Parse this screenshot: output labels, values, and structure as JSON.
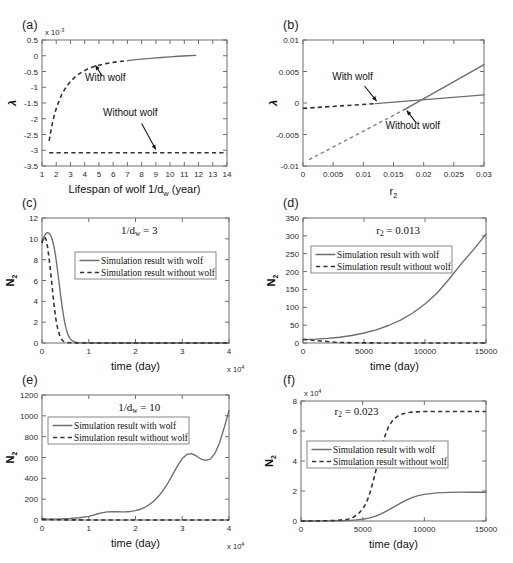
{
  "figure": {
    "panel_labels": {
      "a": "(a)",
      "b": "(b)",
      "c": "(c)",
      "d": "(d)",
      "e": "(e)",
      "f": "(f)"
    },
    "legend_labels": {
      "with": "Simulation result with wolf",
      "without": "Simulation result without wolf"
    },
    "annotations": {
      "with_wolf": "With wolf",
      "without_wolf": "Without wolf"
    },
    "colors": {
      "solid": "#6d6d6d",
      "dashed": "#333333",
      "dashed_light": "#8a8a8a",
      "axis": "#6e6e6e",
      "text": "#111111"
    }
  },
  "chart_data": [
    {
      "id": "a",
      "type": "line",
      "title": "",
      "xlabel": "Lifespan of wolf 1/d_w (year)",
      "ylabel": "λ",
      "y_exponent": "x 10",
      "y_exponent_power": "-3",
      "xlim": [
        1,
        14
      ],
      "ylim": [
        -3.5,
        0.5
      ],
      "xticks": [
        1,
        2,
        3,
        4,
        5,
        6,
        7,
        8,
        9,
        10,
        11,
        12,
        13,
        14
      ],
      "xticklabels": [
        "1",
        "2",
        "3",
        "4",
        "5",
        "6",
        "7",
        "8",
        "9",
        "10",
        "11",
        "12",
        "13",
        "14"
      ],
      "yticks": [
        -3.5,
        -3,
        -2.5,
        -2,
        -1.5,
        -1,
        -0.5,
        0,
        0.5
      ],
      "yticklabels": [
        "-3.5",
        "-3",
        "-2.5",
        "-2",
        "-1.5",
        "-1",
        "-0.5",
        "0",
        "0.5"
      ],
      "grid": false,
      "series": [
        {
          "name": "With wolf (dashed branch)",
          "style": "dashed",
          "x": [
            1.5,
            1.7,
            1.9,
            2.1,
            2.4,
            2.7,
            3.0,
            3.4,
            3.8,
            4.2,
            4.6,
            5.0,
            5.5,
            6.0,
            6.5,
            7.0
          ],
          "y": [
            -2.7,
            -2.2,
            -1.82,
            -1.55,
            -1.22,
            -0.99,
            -0.82,
            -0.64,
            -0.52,
            -0.42,
            -0.35,
            -0.3,
            -0.25,
            -0.21,
            -0.18,
            -0.155
          ]
        },
        {
          "name": "With wolf (solid branch)",
          "style": "solid",
          "x": [
            7.0,
            7.6,
            8.2,
            8.8,
            9.4,
            10.0,
            10.6,
            11.2,
            11.8
          ],
          "y": [
            -0.155,
            -0.125,
            -0.1,
            -0.075,
            -0.055,
            -0.035,
            -0.015,
            0.0,
            0.012
          ]
        },
        {
          "name": "Without wolf",
          "style": "dashed",
          "x": [
            1.5,
            14.0
          ],
          "y": [
            -3.08,
            -3.08
          ]
        }
      ],
      "annotations": [
        {
          "text": "With wolf",
          "text_x": 5.45,
          "text_y": -0.8,
          "arrow_from_x": 5.2,
          "arrow_from_y": -0.63,
          "arrow_to_x": 4.75,
          "arrow_to_y": -0.3
        },
        {
          "text": "Without wolf",
          "text_x": 7.2,
          "text_y": -1.92,
          "arrow_from_x": 8.0,
          "arrow_from_y": -2.15,
          "arrow_to_x": 9.0,
          "arrow_to_y": -2.98
        }
      ]
    },
    {
      "id": "b",
      "type": "line",
      "title": "",
      "xlabel": "r_2",
      "ylabel": "λ",
      "xlim": [
        0,
        0.03
      ],
      "ylim": [
        -0.01,
        0.01
      ],
      "xticks": [
        0,
        0.005,
        0.01,
        0.015,
        0.02,
        0.025,
        0.03
      ],
      "xticklabels": [
        "0",
        "0.005",
        "0.01",
        "0.015",
        "0.02",
        "0.025",
        "0.03"
      ],
      "yticks": [
        -0.01,
        -0.005,
        0,
        0.005,
        0.01
      ],
      "yticklabels": [
        "-0.01",
        "-0.005",
        "0",
        "0.005",
        "0.01"
      ],
      "grid": false,
      "series": [
        {
          "name": "With wolf (dashed branch)",
          "style": "dashed",
          "x": [
            0.0,
            0.012
          ],
          "y": [
            -0.00085,
            -0.0001
          ]
        },
        {
          "name": "With wolf (solid branch)",
          "style": "solid",
          "x": [
            0.012,
            0.03
          ],
          "y": [
            -0.0001,
            0.0013
          ]
        },
        {
          "name": "Without wolf",
          "style": "dashed-light",
          "x": [
            0.001,
            0.0168
          ],
          "y": [
            -0.009,
            -0.00105
          ]
        },
        {
          "name": "Without wolf (solid branch)",
          "style": "solid",
          "x": [
            0.0168,
            0.03
          ],
          "y": [
            -0.00105,
            0.0061
          ]
        }
      ],
      "annotations": [
        {
          "text": "With wolf",
          "text_x": 0.0082,
          "text_y": 0.0036,
          "arrow_from_x": 0.0102,
          "arrow_from_y": 0.0027,
          "arrow_to_x": 0.0122,
          "arrow_to_y": 0.0003
        },
        {
          "text": "Without wolf",
          "text_x": 0.0182,
          "text_y": -0.0042,
          "arrow_from_x": 0.0188,
          "arrow_from_y": -0.0032,
          "arrow_to_x": 0.0172,
          "arrow_to_y": -0.0012
        }
      ]
    },
    {
      "id": "c",
      "type": "line",
      "title": "1/d_w = 3",
      "xlabel": "time (day)",
      "ylabel": "N_2",
      "x_exponent": "x 10",
      "x_exponent_power": "4",
      "xlim": [
        0,
        40000
      ],
      "ylim": [
        0,
        12
      ],
      "xticks": [
        0,
        10000,
        20000,
        30000,
        40000
      ],
      "xticklabels": [
        "0",
        "1",
        "2",
        "3",
        "4"
      ],
      "yticks": [
        0,
        2,
        4,
        6,
        8,
        10,
        12
      ],
      "yticklabels": [
        "0",
        "2",
        "4",
        "6",
        "8",
        "10",
        "12"
      ],
      "grid": false,
      "legend": {
        "position": "upper-center",
        "entries": [
          "Simulation result with wolf",
          "Simulation result without wolf"
        ]
      },
      "series": [
        {
          "name": "Simulation result with wolf",
          "style": "solid",
          "x": [
            0,
            400,
            800,
            1200,
            1600,
            2000,
            2400,
            2800,
            3200,
            3600,
            4000,
            4400,
            4800,
            5200,
            5600,
            6000,
            6500,
            7000,
            7500,
            8000,
            9000,
            12000,
            20000,
            30000,
            40000
          ],
          "y": [
            9.7,
            10.2,
            10.5,
            10.6,
            10.5,
            10.2,
            9.6,
            8.7,
            7.4,
            6.0,
            4.5,
            3.2,
            2.1,
            1.3,
            0.75,
            0.42,
            0.2,
            0.1,
            0.05,
            0.03,
            0.01,
            0.0,
            0.0,
            0.0,
            0.0
          ]
        },
        {
          "name": "Simulation result without wolf",
          "style": "dashed",
          "x": [
            0,
            300,
            600,
            900,
            1200,
            1500,
            1800,
            2100,
            2400,
            2700,
            3000,
            3400,
            3800,
            4200,
            4600,
            5000,
            6000,
            8000,
            12000,
            20000,
            30000,
            40000
          ],
          "y": [
            9.6,
            10.1,
            10.2,
            9.9,
            9.2,
            8.2,
            7.0,
            5.7,
            4.4,
            3.2,
            2.2,
            1.3,
            0.7,
            0.35,
            0.15,
            0.07,
            0.02,
            0.0,
            0.0,
            0.0,
            0.0,
            0.0
          ]
        }
      ]
    },
    {
      "id": "d",
      "type": "line",
      "title": "r_2 = 0.013",
      "xlabel": "time (day)",
      "ylabel": "N_2",
      "xlim": [
        0,
        15000
      ],
      "ylim": [
        0,
        350
      ],
      "xticks": [
        0,
        5000,
        10000,
        15000
      ],
      "xticklabels": [
        "0",
        "5000",
        "10000",
        "15000"
      ],
      "yticks": [
        0,
        50,
        100,
        150,
        200,
        250,
        300,
        350
      ],
      "yticklabels": [
        "0",
        "50",
        "100",
        "150",
        "200",
        "250",
        "300",
        "350"
      ],
      "grid": false,
      "legend": {
        "position": "upper-left",
        "entries": [
          "Simulation result with wolf",
          "Simulation result without wolf"
        ]
      },
      "series": [
        {
          "name": "Simulation result with wolf",
          "style": "solid",
          "x": [
            0,
            1000,
            2000,
            3000,
            4000,
            5000,
            6000,
            7000,
            8000,
            9000,
            10000,
            11000,
            12000,
            13000,
            14000,
            15000
          ],
          "y": [
            10,
            11,
            13,
            16,
            21,
            28,
            37,
            49,
            64,
            84,
            109,
            140,
            180,
            223,
            262,
            305
          ]
        },
        {
          "name": "Simulation result without wolf",
          "style": "dashed",
          "x": [
            0,
            500,
            1000,
            1500,
            2000,
            2500,
            3000,
            4000,
            6000,
            9000,
            12000,
            15000
          ],
          "y": [
            10,
            8.5,
            7,
            5.5,
            4,
            2.6,
            1.6,
            0.7,
            0.2,
            0.05,
            0.0,
            0.0
          ]
        }
      ]
    },
    {
      "id": "e",
      "type": "line",
      "title": "1/d_w = 10",
      "xlabel": "time (day)",
      "ylabel": "N_2",
      "x_exponent": "x 10",
      "x_exponent_power": "4",
      "xlim": [
        0,
        40000
      ],
      "ylim": [
        0,
        1200
      ],
      "xticks": [
        0,
        10000,
        20000,
        30000,
        40000
      ],
      "xticklabels": [
        "0",
        "1",
        "2",
        "3",
        "4"
      ],
      "yticks": [
        0,
        200,
        400,
        600,
        800,
        1000,
        1200
      ],
      "yticklabels": [
        "0",
        "200",
        "400",
        "600",
        "800",
        "1000",
        "1200"
      ],
      "grid": false,
      "legend": {
        "position": "upper-left",
        "entries": [
          "Simulation result with wolf",
          "Simulation result without wolf"
        ]
      },
      "series": [
        {
          "name": "Simulation result with wolf",
          "style": "solid",
          "x": [
            0,
            2000,
            4000,
            6000,
            8000,
            10000,
            11000,
            12000,
            13000,
            14000,
            15000,
            16000,
            17000,
            18000,
            19000,
            20000,
            21000,
            22000,
            23000,
            24000,
            25000,
            26000,
            27000,
            28000,
            29000,
            30000,
            31000,
            32000,
            33000,
            34000,
            35000,
            36000,
            37000,
            38000,
            39000,
            40000
          ],
          "y": [
            8,
            9,
            11,
            15,
            22,
            35,
            47,
            60,
            71,
            78,
            80,
            79,
            78,
            79,
            82,
            90,
            103,
            122,
            148,
            185,
            232,
            290,
            360,
            440,
            520,
            590,
            630,
            638,
            615,
            585,
            572,
            585,
            640,
            745,
            890,
            1050
          ]
        },
        {
          "name": "Simulation result without wolf",
          "style": "dashed",
          "x": [
            0,
            2000,
            5000,
            10000,
            20000,
            30000,
            40000
          ],
          "y": [
            8,
            4,
            1.5,
            0.4,
            0.0,
            0.0,
            0.0
          ]
        }
      ]
    },
    {
      "id": "f",
      "type": "line",
      "title": "r_2 = 0.023",
      "xlabel": "time (day)",
      "ylabel": "N_2",
      "y_exponent": "x 10",
      "y_exponent_power": "4",
      "xlim": [
        0,
        15000
      ],
      "ylim": [
        0,
        80000
      ],
      "xticks": [
        0,
        5000,
        10000,
        15000
      ],
      "xticklabels": [
        "0",
        "5000",
        "10000",
        "15000"
      ],
      "yticks": [
        0,
        20000,
        40000,
        60000,
        80000
      ],
      "yticklabels": [
        "0",
        "2",
        "4",
        "6",
        "8"
      ],
      "grid": false,
      "legend": {
        "position": "mid-left",
        "entries": [
          "Simulation result with wolf",
          "Simulation result without wolf"
        ]
      },
      "series": [
        {
          "name": "Simulation result with wolf",
          "style": "solid",
          "x": [
            0,
            1000,
            2000,
            3000,
            4000,
            4500,
            5000,
            5500,
            6000,
            6500,
            7000,
            7500,
            8000,
            8500,
            9000,
            9500,
            10000,
            11000,
            12000,
            13000,
            14000,
            15000
          ],
          "y": [
            10,
            20,
            60,
            180,
            420,
            700,
            1150,
            1900,
            3100,
            4800,
            6900,
            9200,
            11600,
            13800,
            15600,
            16900,
            17800,
            18800,
            19100,
            19200,
            19200,
            19200
          ]
        },
        {
          "name": "Simulation result without wolf",
          "style": "dashed",
          "x": [
            0,
            1000,
            2000,
            3000,
            3800,
            4200,
            4600,
            5000,
            5300,
            5600,
            5900,
            6200,
            6500,
            6800,
            7100,
            7500,
            8000,
            8600,
            9200,
            10000,
            11000,
            12500,
            14000,
            15000
          ],
          "y": [
            10,
            30,
            120,
            450,
            1200,
            2300,
            4300,
            8000,
            12000,
            19000,
            28000,
            38000,
            48000,
            56500,
            63000,
            67800,
            70800,
            72200,
            72700,
            73000,
            73000,
            73000,
            73000,
            73000
          ]
        }
      ]
    }
  ]
}
